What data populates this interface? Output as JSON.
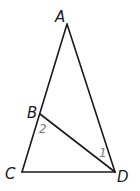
{
  "diagram": {
    "type": "geometry",
    "vertices": [
      {
        "id": "A",
        "label": "A",
        "x": 67,
        "y": 24,
        "label_x": 55,
        "label_y": 22
      },
      {
        "id": "B",
        "label": "B",
        "x": 40,
        "y": 114,
        "label_x": 27,
        "label_y": 118
      },
      {
        "id": "C",
        "label": "C",
        "x": 22,
        "y": 172,
        "label_x": 5,
        "label_y": 179
      },
      {
        "id": "D",
        "label": "D",
        "x": 115,
        "y": 172,
        "label_x": 117,
        "label_y": 182
      }
    ],
    "segments": [
      {
        "from": "A",
        "to": "C"
      },
      {
        "from": "A",
        "to": "D"
      },
      {
        "from": "C",
        "to": "D"
      },
      {
        "from": "B",
        "to": "D"
      }
    ],
    "angle_labels": [
      {
        "label": "2",
        "at": "B",
        "x": 39,
        "y": 133
      },
      {
        "label": "1",
        "at": "D",
        "x": 99,
        "y": 157
      }
    ],
    "colors": {
      "lines": "#1a1a1a",
      "vertex_labels": "#1a1a1a",
      "angle_labels": "#7a7a7a"
    }
  }
}
